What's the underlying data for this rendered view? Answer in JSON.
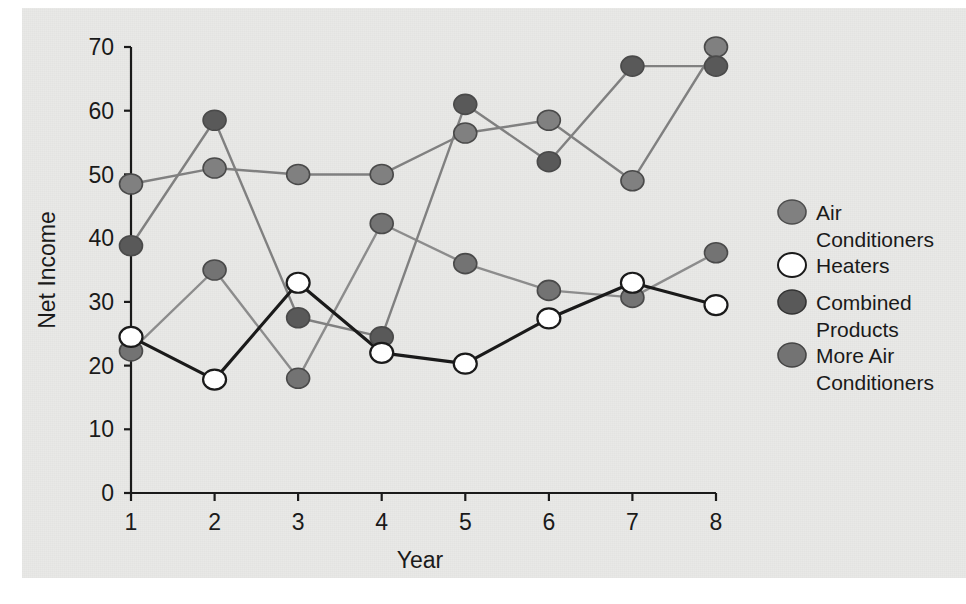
{
  "chart_data": {
    "type": "line",
    "title": "",
    "xlabel": "Year",
    "ylabel": "Net Income",
    "x": [
      1,
      2,
      3,
      4,
      5,
      6,
      7,
      8
    ],
    "xtick_labels": [
      "1",
      "2",
      "3",
      "4",
      "5",
      "6",
      "7",
      "8"
    ],
    "ytick_labels": [
      "0",
      "10",
      "20",
      "30",
      "40",
      "50",
      "60",
      "70"
    ],
    "xlim": [
      1,
      8
    ],
    "ylim": [
      0,
      70
    ],
    "grid": false,
    "legend_position": "right",
    "series": [
      {
        "name": "Air Conditioners",
        "marker_color": "#808080",
        "line_color": "#808080",
        "values": [
          48.5,
          51,
          50,
          50,
          56.5,
          58.5,
          49,
          70
        ]
      },
      {
        "name": "Heaters",
        "marker_color": "#ffffff",
        "line_color": "#1a1a1a",
        "values": [
          24.5,
          17.8,
          33,
          22,
          20.3,
          27.4,
          33,
          29.5
        ]
      },
      {
        "name": "Combined Products",
        "marker_color": "#595959",
        "line_color": "#808080",
        "values": [
          38.8,
          58.5,
          27.5,
          24.5,
          61,
          52,
          67,
          67
        ]
      },
      {
        "name": "More Air Conditioners",
        "marker_color": "#737373",
        "line_color": "#8c8c8c",
        "values": [
          22.3,
          35,
          18,
          42.3,
          36,
          31.8,
          30.7,
          37.7
        ]
      }
    ]
  },
  "axes": {
    "y_title": "Net Income",
    "x_title": "Year"
  },
  "legend": {
    "entries": [
      {
        "label_line1": "Air",
        "label_line2": "Conditioners",
        "swatch": "marker-swatch-air-conditioners"
      },
      {
        "label_line1": "Heaters",
        "label_line2": "",
        "swatch": "marker-swatch-heaters"
      },
      {
        "label_line1": "Combined",
        "label_line2": "Products",
        "swatch": "marker-swatch-combined-products"
      },
      {
        "label_line1": "More Air",
        "label_line2": "Conditioners",
        "swatch": "marker-swatch-more-air-conditioners"
      }
    ]
  },
  "colors": {
    "panel_background": "#e9e9e7",
    "axis": "#1a1a1a",
    "series_air_conditioners": "#808080",
    "series_heaters_fill": "#ffffff",
    "series_heaters_line": "#1a1a1a",
    "series_combined_products": "#595959",
    "series_more_air_conditioners": "#737373"
  }
}
